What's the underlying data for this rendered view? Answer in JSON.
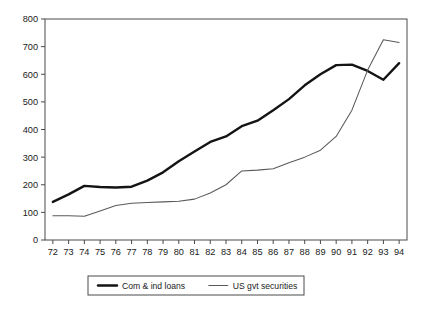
{
  "chart_data": {
    "type": "line",
    "title": "",
    "xlabel": "",
    "ylabel": "",
    "ylim": [
      0,
      800
    ],
    "ytick_step": 100,
    "yticks": [
      "0",
      "100",
      "200",
      "300",
      "400",
      "500",
      "600",
      "700",
      "800"
    ],
    "grid": false,
    "legend_position": "bottom-center",
    "frame": "box",
    "categories": [
      "72",
      "73",
      "74",
      "75",
      "76",
      "77",
      "78",
      "79",
      "80",
      "81",
      "82",
      "83",
      "84",
      "85",
      "86",
      "87",
      "88",
      "89",
      "90",
      "91",
      "92",
      "93",
      "94"
    ],
    "x": [
      72,
      73,
      74,
      75,
      76,
      77,
      78,
      79,
      80,
      81,
      82,
      83,
      84,
      85,
      86,
      87,
      88,
      89,
      90,
      91,
      92,
      93,
      94
    ],
    "series": [
      {
        "name": "Com & ind loans",
        "style": "thick-solid",
        "color": "#141414",
        "values": [
          138,
          165,
          196,
          192,
          190,
          193,
          215,
          245,
          285,
          320,
          355,
          375,
          412,
          432,
          470,
          510,
          560,
          600,
          633,
          635,
          612,
          580,
          640
        ]
      },
      {
        "name": "US gvt securities",
        "style": "thin-solid",
        "color": "#595959",
        "values": [
          88,
          88,
          86,
          105,
          125,
          133,
          136,
          138,
          140,
          148,
          170,
          200,
          250,
          253,
          258,
          280,
          300,
          325,
          375,
          470,
          615,
          725,
          715
        ]
      }
    ],
    "legend": [
      {
        "label": "Com & ind loans",
        "style": "thick-solid"
      },
      {
        "label": "US gvt securities",
        "style": "thin-solid"
      }
    ]
  }
}
